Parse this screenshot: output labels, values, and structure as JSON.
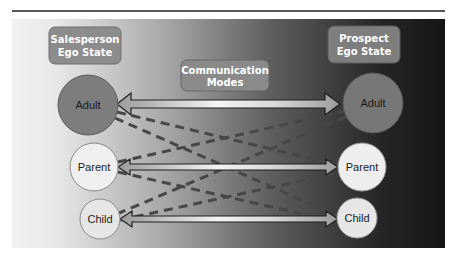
{
  "diagram": {
    "title_rule": true,
    "labels": {
      "salesperson": [
        "Salesperson",
        "Ego State"
      ],
      "prospect": [
        "Prospect",
        "Ego State"
      ],
      "communication": [
        "Communication",
        "Modes"
      ]
    },
    "salesperson_states": [
      {
        "label": "Adult",
        "color": "#7d7d7d"
      },
      {
        "label": "Parent",
        "color": "#eeeeee"
      },
      {
        "label": "Child",
        "color": "#e6e6e6"
      }
    ],
    "prospect_states": [
      {
        "label": "Adult",
        "color": "#7a7a7a"
      },
      {
        "label": "Parent",
        "color": "#eeeeee"
      },
      {
        "label": "Child",
        "color": "#e6e6e6"
      }
    ],
    "solid_arrows": [
      {
        "from": "Adult",
        "to": "Adult"
      },
      {
        "from": "Parent",
        "to": "Parent"
      },
      {
        "from": "Child",
        "to": "Child"
      }
    ],
    "dashed_lines": [
      {
        "from": "Adult",
        "to": "Parent"
      },
      {
        "from": "Adult",
        "to": "Child"
      },
      {
        "from": "Parent",
        "to": "Adult"
      },
      {
        "from": "Parent",
        "to": "Child"
      },
      {
        "from": "Child",
        "to": "Adult"
      },
      {
        "from": "Child",
        "to": "Parent"
      }
    ],
    "colors": {
      "box_fill": "#8a8a8a",
      "box_stroke": "#6a6a6a",
      "dash": "#4a4a4a",
      "arrow_outline": "#222222",
      "rule": "#222222"
    }
  }
}
